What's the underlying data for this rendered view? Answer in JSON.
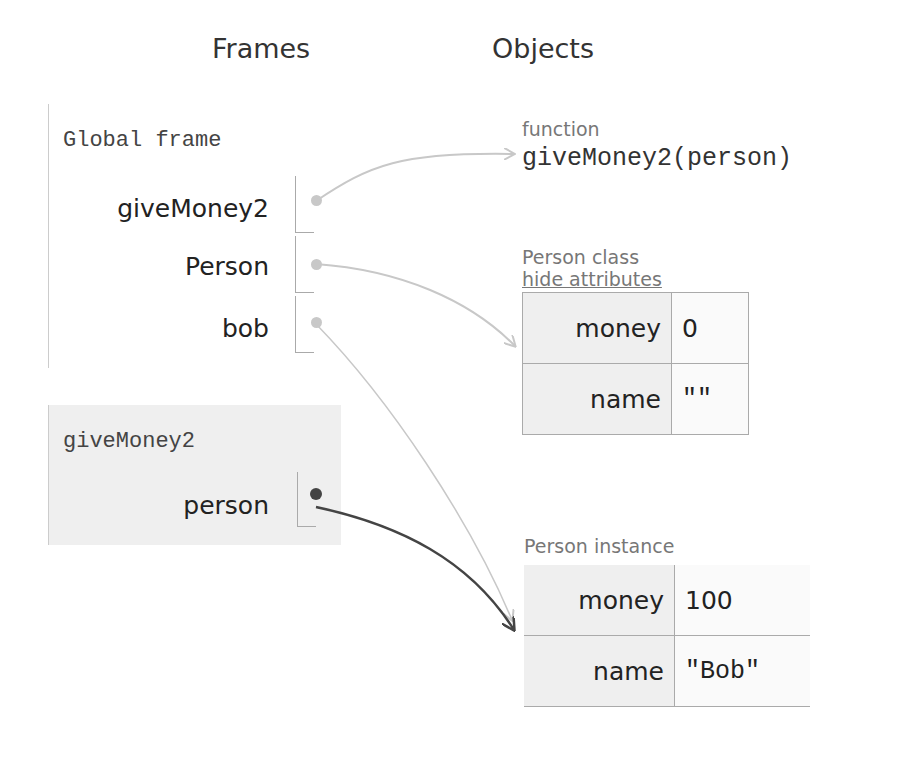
{
  "headings": {
    "frames": "Frames",
    "objects": "Objects"
  },
  "frames": [
    {
      "title": "Global frame",
      "variables": [
        {
          "name": "giveMoney2",
          "target": "function giveMoney2"
        },
        {
          "name": "Person",
          "target": "Person class"
        },
        {
          "name": "bob",
          "target": "Person instance"
        }
      ]
    },
    {
      "title": "giveMoney2",
      "variables": [
        {
          "name": "person",
          "target": "Person instance"
        }
      ]
    }
  ],
  "objects": {
    "function": {
      "type_label": "function",
      "signature": "giveMoney2(person)"
    },
    "person_class": {
      "type_label": "Person class",
      "toggle_link": "hide attributes",
      "attributes": [
        {
          "key": "money",
          "value": "0"
        },
        {
          "key": "name",
          "value": "\"\""
        }
      ]
    },
    "person_instance": {
      "type_label": "Person instance",
      "attributes": [
        {
          "key": "money",
          "value": "100"
        },
        {
          "key": "name",
          "value": "\"Bob\""
        }
      ]
    }
  },
  "colors": {
    "inactive_arrow": "#c8c8c8",
    "active_arrow": "#444444",
    "frame_bg_active": "#efefef"
  }
}
